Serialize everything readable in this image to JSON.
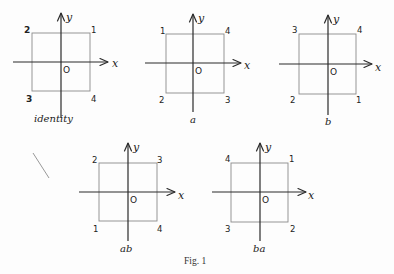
{
  "figure": {
    "caption": "Fig. 1",
    "axis_labels": {
      "x": "x",
      "y": "y",
      "origin": "O"
    },
    "panels": [
      {
        "id": "identity",
        "caption": "identity",
        "corners": {
          "top_left": "2",
          "top_right": "1",
          "bottom_left": "3",
          "bottom_right": "4"
        }
      },
      {
        "id": "a",
        "caption": "a",
        "corners": {
          "top_left": "1",
          "top_right": "4",
          "bottom_left": "2",
          "bottom_right": "3"
        }
      },
      {
        "id": "b",
        "caption": "b",
        "corners": {
          "top_left": "3",
          "top_right": "4",
          "bottom_left": "2",
          "bottom_right": "1"
        }
      },
      {
        "id": "ab",
        "caption": "ab",
        "corners": {
          "top_left": "2",
          "top_right": "3",
          "bottom_left": "1",
          "bottom_right": "4"
        }
      },
      {
        "id": "ba",
        "caption": "ba",
        "corners": {
          "top_left": "4",
          "top_right": "1",
          "bottom_left": "3",
          "bottom_right": "2"
        }
      }
    ]
  }
}
